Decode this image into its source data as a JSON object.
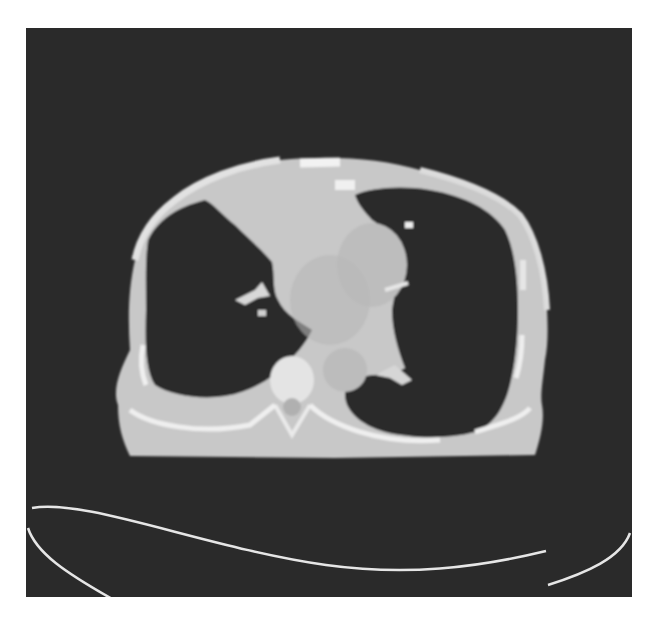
{
  "image": {
    "kind": "axial chest CT slice",
    "colors": {
      "background": "#ffffff",
      "scan_background": "#2b2b2b",
      "soft_tissue": "#c9c9c9",
      "mediastinum": "#bdbdbd",
      "bone": "#ececec",
      "lung": "#2a2a2a",
      "table_line": "#e6e6e6"
    }
  }
}
